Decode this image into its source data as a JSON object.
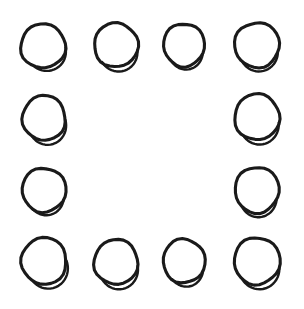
{
  "canvas": {
    "width": 304,
    "height": 309,
    "background_color": "#ffffff",
    "title": "hand-drawn-circles-square-ring"
  },
  "style": {
    "stroke_color": "#1a1a1a",
    "main_stroke_width": 3.1,
    "overshoot_stroke_width": 2.4,
    "fill": "none",
    "technique": "hand-drawn circle with bottom-left overshoot arc"
  },
  "layout": {
    "arrangement": "hollow square ring",
    "rows": 4,
    "columns": 4,
    "total_shapes": 12,
    "empty_center_cells": 4,
    "column_centers_x": [
      43,
      116,
      184,
      257
    ],
    "row_centers_y": [
      46,
      118,
      191,
      261
    ]
  },
  "shapes": [
    {
      "id": "circle-r1c1",
      "row": 1,
      "col": 1,
      "cx": 43.0,
      "cy": 46.0,
      "rx": 22.5,
      "ry": 22.0,
      "rotation": -6,
      "overshoot_start_deg": 120,
      "overshoot_sweep_deg": 110,
      "overshoot_offset": 4.0
    },
    {
      "id": "circle-r1c2",
      "row": 1,
      "col": 2,
      "cx": 116.0,
      "cy": 45.0,
      "rx": 22.0,
      "ry": 22.0,
      "rotation": 4,
      "overshoot_start_deg": 125,
      "overshoot_sweep_deg": 115,
      "overshoot_offset": 5.0
    },
    {
      "id": "circle-r1c3",
      "row": 1,
      "col": 3,
      "cx": 184.0,
      "cy": 45.0,
      "rx": 20.5,
      "ry": 21.5,
      "rotation": -4,
      "overshoot_start_deg": 128,
      "overshoot_sweep_deg": 100,
      "overshoot_offset": 3.4
    },
    {
      "id": "circle-r1c4",
      "row": 1,
      "col": 4,
      "cx": 257.0,
      "cy": 45.0,
      "rx": 22.5,
      "ry": 22.5,
      "rotation": 8,
      "overshoot_start_deg": 122,
      "overshoot_sweep_deg": 108,
      "overshoot_offset": 4.2
    },
    {
      "id": "circle-r2c1",
      "row": 2,
      "col": 1,
      "cx": 44.0,
      "cy": 118.0,
      "rx": 21.5,
      "ry": 22.5,
      "rotation": -3,
      "overshoot_start_deg": 126,
      "overshoot_sweep_deg": 118,
      "overshoot_offset": 5.2
    },
    {
      "id": "circle-r2c4",
      "row": 2,
      "col": 4,
      "cx": 257.0,
      "cy": 117.0,
      "rx": 22.5,
      "ry": 23.0,
      "rotation": 5,
      "overshoot_start_deg": 124,
      "overshoot_sweep_deg": 114,
      "overshoot_offset": 5.0
    },
    {
      "id": "circle-r3c1",
      "row": 3,
      "col": 1,
      "cx": 44.0,
      "cy": 190.0,
      "rx": 22.0,
      "ry": 22.0,
      "rotation": -8,
      "overshoot_start_deg": 130,
      "overshoot_sweep_deg": 95,
      "overshoot_offset": 3.6
    },
    {
      "id": "circle-r3c4",
      "row": 3,
      "col": 4,
      "cx": 257.0,
      "cy": 190.0,
      "rx": 22.0,
      "ry": 23.0,
      "rotation": 6,
      "overshoot_start_deg": 126,
      "overshoot_sweep_deg": 105,
      "overshoot_offset": 4.4
    },
    {
      "id": "circle-r4c1",
      "row": 4,
      "col": 1,
      "cx": 44.0,
      "cy": 261.0,
      "rx": 22.5,
      "ry": 23.5,
      "rotation": -5,
      "overshoot_start_deg": 124,
      "overshoot_sweep_deg": 120,
      "overshoot_offset": 5.4
    },
    {
      "id": "circle-r4c2",
      "row": 4,
      "col": 2,
      "cx": 116.0,
      "cy": 262.0,
      "rx": 22.0,
      "ry": 22.5,
      "rotation": 6,
      "overshoot_start_deg": 122,
      "overshoot_sweep_deg": 118,
      "overshoot_offset": 5.4
    },
    {
      "id": "circle-r4c3",
      "row": 4,
      "col": 3,
      "cx": 184.0,
      "cy": 261.0,
      "rx": 21.0,
      "ry": 22.0,
      "rotation": -4,
      "overshoot_start_deg": 128,
      "overshoot_sweep_deg": 100,
      "overshoot_offset": 4.0
    },
    {
      "id": "circle-r4c4",
      "row": 4,
      "col": 4,
      "cx": 257.0,
      "cy": 261.0,
      "rx": 23.0,
      "ry": 23.5,
      "rotation": 7,
      "overshoot_start_deg": 123,
      "overshoot_sweep_deg": 116,
      "overshoot_offset": 5.2
    }
  ]
}
